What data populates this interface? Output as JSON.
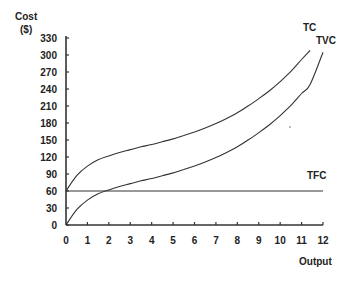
{
  "chart_data": {
    "type": "line",
    "title": "",
    "ylabel": "Cost\n($)",
    "ylabel_line1": "Cost",
    "ylabel_line2": "($)",
    "xlabel": "Output",
    "xlim": [
      0,
      12
    ],
    "ylim": [
      0,
      330
    ],
    "x_ticks": [
      0,
      1,
      2,
      3,
      4,
      5,
      6,
      7,
      8,
      9,
      10,
      11,
      12
    ],
    "y_ticks": [
      0,
      30,
      60,
      90,
      120,
      150,
      180,
      210,
      240,
      270,
      300,
      330
    ],
    "grid": false,
    "legend": "inline labels at curve ends",
    "x": [
      0,
      0.5,
      1,
      1.5,
      2,
      2.5,
      3,
      3.5,
      4,
      4.5,
      5,
      5.5,
      6,
      6.5,
      7,
      7.5,
      8,
      8.5,
      9,
      9.5,
      10,
      10.5,
      11,
      11.4,
      12
    ],
    "series": [
      {
        "name": "TC",
        "values": [
          60,
          87,
          104,
          115,
          122,
          128,
          133,
          138,
          142,
          147,
          152,
          158,
          164,
          171,
          179,
          188,
          198,
          210,
          223,
          237,
          253,
          271,
          292,
          308,
          null
        ]
      },
      {
        "name": "TVC",
        "values": [
          0,
          27,
          44,
          55,
          62,
          68,
          73,
          78,
          82,
          87,
          92,
          98,
          104,
          111,
          119,
          128,
          138,
          150,
          163,
          177,
          193,
          211,
          232,
          248,
          305
        ]
      },
      {
        "name": "TFC",
        "values": [
          60,
          60,
          60,
          60,
          60,
          60,
          60,
          60,
          60,
          60,
          60,
          60,
          60,
          60,
          60,
          60,
          60,
          60,
          60,
          60,
          60,
          60,
          60,
          60,
          60
        ]
      }
    ],
    "annotations": [
      "TC",
      "TVC",
      "TFC"
    ]
  },
  "labels": {
    "y_axis_line1": "Cost",
    "y_axis_line2": "($)",
    "x_axis": "Output",
    "tc": "TC",
    "tvc": "TVC",
    "tfc": "TFC"
  },
  "colors": {
    "axis": "#333333",
    "curve": "#333333",
    "text": "#222222",
    "background": "#ffffff"
  }
}
